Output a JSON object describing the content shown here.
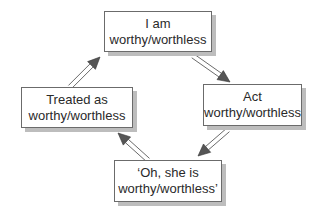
{
  "diagram": {
    "type": "cycle",
    "nodes": [
      {
        "id": "top",
        "line1": "I am",
        "line2": "worthy/worthless"
      },
      {
        "id": "right",
        "line1": "Act",
        "line2": "worthy/worthless"
      },
      {
        "id": "bottom",
        "line1": "‘Oh, she is",
        "line2": "worthy/worthless’"
      },
      {
        "id": "left",
        "line1": "Treated as",
        "line2": "worthy/worthless"
      }
    ],
    "edges": [
      {
        "from": "top",
        "to": "right"
      },
      {
        "from": "right",
        "to": "bottom"
      },
      {
        "from": "bottom",
        "to": "left"
      },
      {
        "from": "left",
        "to": "top"
      }
    ],
    "colors": {
      "border": "#6b6b6b",
      "shadow": "#bdbdbd",
      "arrow_head": "#555555",
      "text": "#2a2a2a"
    }
  }
}
